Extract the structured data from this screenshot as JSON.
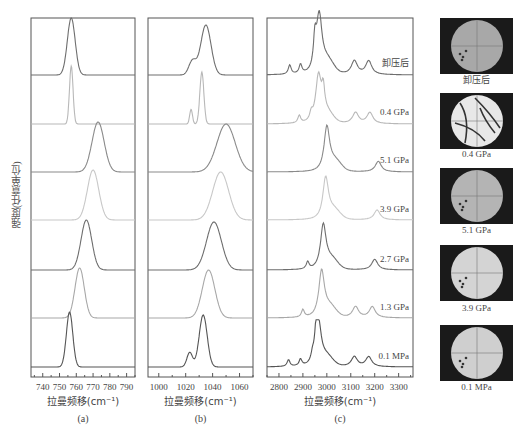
{
  "figure": {
    "ylabel": "强度(任意单位)",
    "panels": [
      {
        "id": "a",
        "caption": "(a)",
        "xlabel": "拉曼频移(cm⁻¹)",
        "ticks": [
          "740",
          "750",
          "760",
          "770",
          "780",
          "790"
        ]
      },
      {
        "id": "b",
        "caption": "(b)",
        "xlabel": "拉曼频移(cm⁻¹)",
        "ticks": [
          "1000",
          "1020",
          "1040",
          "1060"
        ]
      },
      {
        "id": "c",
        "caption": "(c)",
        "xlabel": "拉曼频移(cm⁻¹)",
        "ticks": [
          "2800",
          "2900",
          "3000",
          "3100",
          "3200",
          "3300"
        ]
      }
    ],
    "trace_labels": [
      "卸压后",
      "0.4 GPa",
      "5.1 GPa",
      "3.9 GPa",
      "2.7 GPa",
      "1.3 GPa",
      "0.1 MPa"
    ],
    "image_labels": [
      "卸压后",
      "0.4 GPa",
      "5.1 GPa",
      "3.9 GPa",
      "0.1 MPa"
    ]
  },
  "chart_data": [
    {
      "type": "line",
      "title": "(a)",
      "xlabel": "拉曼频移(cm⁻¹)",
      "ylabel": "强度(任意单位)",
      "xlim": [
        733,
        795
      ],
      "xticks": [
        740,
        750,
        760,
        770,
        780,
        790
      ],
      "grid": false,
      "stacked_offset": true,
      "series": [
        {
          "name": "卸压后",
          "peak_center": 757,
          "fwhm": 5.5,
          "color": "#6e6e6e"
        },
        {
          "name": "0.4 GPa",
          "peak_center": 757,
          "fwhm": 2.5,
          "color": "#b8b8b8"
        },
        {
          "name": "5.1 GPa",
          "peak_center": 773,
          "fwhm": 8.5,
          "color": "#8a8a8a"
        },
        {
          "name": "3.9 GPa",
          "peak_center": 770,
          "fwhm": 8,
          "color": "#c8c8c8"
        },
        {
          "name": "2.7 GPa",
          "peak_center": 766,
          "fwhm": 7.5,
          "color": "#6e6e6e"
        },
        {
          "name": "1.3 GPa",
          "peak_center": 762,
          "fwhm": 6.5,
          "color": "#a8a8a8"
        },
        {
          "name": "0.1 MPa",
          "peak_center": 756,
          "fwhm": 4.5,
          "color": "#555555"
        }
      ]
    },
    {
      "type": "line",
      "title": "(b)",
      "xlabel": "拉曼频移(cm⁻¹)",
      "ylabel": "强度(任意单位)",
      "xlim": [
        992,
        1070
      ],
      "xticks": [
        1000,
        1020,
        1040,
        1060
      ],
      "grid": false,
      "stacked_offset": true,
      "series": [
        {
          "name": "卸压后",
          "peak_center": 1035,
          "shoulder": 1025,
          "fwhm": 9,
          "color": "#6e6e6e"
        },
        {
          "name": "0.4 GPa",
          "peak_center": 1032,
          "shoulder": 1024,
          "fwhm": 3.5,
          "color": "#b8b8b8"
        },
        {
          "name": "5.1 GPa",
          "peak_center": 1050,
          "fwhm": 16,
          "color": "#8a8a8a"
        },
        {
          "name": "3.9 GPa",
          "peak_center": 1046,
          "fwhm": 14,
          "color": "#c8c8c8"
        },
        {
          "name": "2.7 GPa",
          "peak_center": 1041,
          "fwhm": 13,
          "color": "#6e6e6e"
        },
        {
          "name": "1.3 GPa",
          "peak_center": 1037,
          "fwhm": 11,
          "color": "#a8a8a8"
        },
        {
          "name": "0.1 MPa",
          "peak_center": 1033,
          "shoulder": 1023,
          "fwhm": 7,
          "color": "#555555"
        }
      ]
    },
    {
      "type": "line",
      "title": "(c)",
      "xlabel": "拉曼频移(cm⁻¹)",
      "ylabel": "强度(任意单位)",
      "xlim": [
        2750,
        3360
      ],
      "xticks": [
        2800,
        2900,
        3000,
        3100,
        3200,
        3300
      ],
      "grid": false,
      "stacked_offset": true,
      "series": [
        {
          "name": "卸压后",
          "peak_center": 2968,
          "side_peaks": [
            2845,
            2890,
            2950,
            3115,
            3175
          ],
          "color": "#6e6e6e"
        },
        {
          "name": "0.4 GPa",
          "peak_center": 2965,
          "side_peaks": [
            2885,
            2935,
            2985,
            3120,
            3180
          ],
          "color": "#b8b8b8"
        },
        {
          "name": "5.1 GPa",
          "peak_center": 3000,
          "side_peaks": [
            3215
          ],
          "color": "#8a8a8a"
        },
        {
          "name": "3.9 GPa",
          "peak_center": 2995,
          "side_peaks": [
            3210
          ],
          "color": "#c8c8c8"
        },
        {
          "name": "2.7 GPa",
          "peak_center": 2985,
          "side_peaks": [
            2920,
            3200
          ],
          "color": "#6e6e6e"
        },
        {
          "name": "1.3 GPa",
          "peak_center": 2978,
          "side_peaks": [
            2900,
            3120,
            3190
          ],
          "color": "#a8a8a8"
        },
        {
          "name": "0.1 MPa",
          "peak_center": 2965,
          "side_peaks": [
            2840,
            2890,
            2940,
            2955,
            3115,
            3175
          ],
          "color": "#555555"
        }
      ]
    }
  ]
}
